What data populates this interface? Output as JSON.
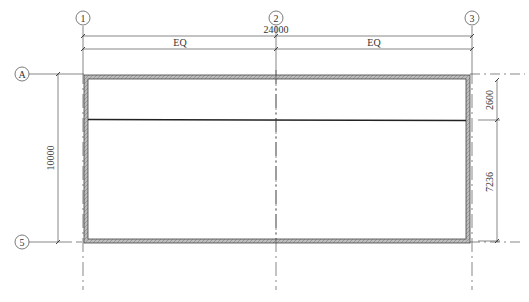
{
  "drawing": {
    "type": "floor plan",
    "grid_lines": {
      "vertical": [
        {
          "label": "1",
          "x": 83
        },
        {
          "label": "2",
          "x": 276
        },
        {
          "label": "3",
          "x": 472
        }
      ],
      "horizontal": [
        {
          "label": "A",
          "y": 74
        },
        {
          "label": "5",
          "y": 242
        }
      ]
    },
    "dimensions": {
      "overall_width": "24000",
      "segments": [
        "EQ",
        "EQ"
      ],
      "overall_height": "10000",
      "right_upper": "2600",
      "right_lower": "7236"
    },
    "colors": {
      "line": "#333333",
      "wall": "#777777",
      "background": "#ffffff"
    }
  }
}
